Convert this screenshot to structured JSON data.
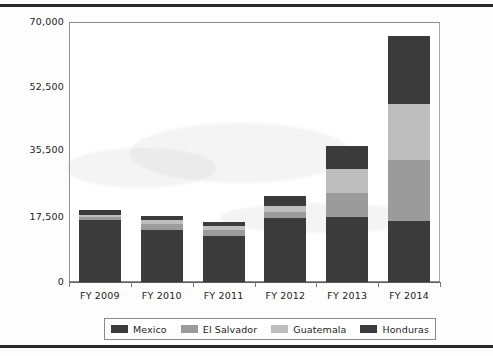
{
  "chart_data": {
    "type": "bar",
    "subtype": "stacked-bar",
    "title": "",
    "xlabel": "",
    "ylabel": "",
    "categories": [
      "FY 2009",
      "FY 2010",
      "FY 2011",
      "FY 2012",
      "FY 2013",
      "FY 2014"
    ],
    "ylim": [
      0,
      70000
    ],
    "yticks": [
      0,
      17500,
      35500,
      52500,
      70000
    ],
    "ytick_labels": [
      "0",
      "17,500",
      "35,500",
      "52,500",
      "70,000"
    ],
    "grid": false,
    "legend_position": "bottom",
    "series": [
      {
        "name": "Mexico",
        "color": "#3b3b3b",
        "values": [
          16700,
          14000,
          12500,
          17200,
          17500,
          16400
        ]
      },
      {
        "name": "El Salvador",
        "color": "#9b9b9b",
        "values": [
          700,
          1500,
          1600,
          1700,
          6500,
          16400
        ]
      },
      {
        "name": "Guatemala",
        "color": "#bebebe",
        "values": [
          700,
          1100,
          1000,
          1600,
          6500,
          15100
        ]
      },
      {
        "name": "Honduras",
        "color": "#3b3b3b",
        "values": [
          1300,
          1100,
          1100,
          2600,
          6200,
          18300
        ]
      }
    ],
    "totals": [
      19400,
      17700,
      16200,
      23100,
      36700,
      66200
    ]
  },
  "legend": {
    "items": [
      {
        "label": "Mexico",
        "color": "#3b3b3b"
      },
      {
        "label": "El Salvador",
        "color": "#9b9b9b"
      },
      {
        "label": "Guatemala",
        "color": "#bebebe"
      },
      {
        "label": "Honduras",
        "color": "#3b3b3b"
      }
    ]
  },
  "axis": {
    "y_labels": [
      "70,000",
      "52,500",
      "35,500",
      "17,500",
      "0"
    ],
    "x_labels": [
      "FY 2009",
      "FY 2010",
      "FY 2011",
      "FY 2012",
      "FY 2013",
      "FY 2014"
    ]
  },
  "colors": {
    "mexico": "#3b3b3b",
    "el_salvador": "#9b9b9b",
    "guatemala": "#bebebe",
    "honduras": "#3b3b3b",
    "rule": "#2a2a2a",
    "frame": "#8e8e8e",
    "text": "#222222"
  }
}
